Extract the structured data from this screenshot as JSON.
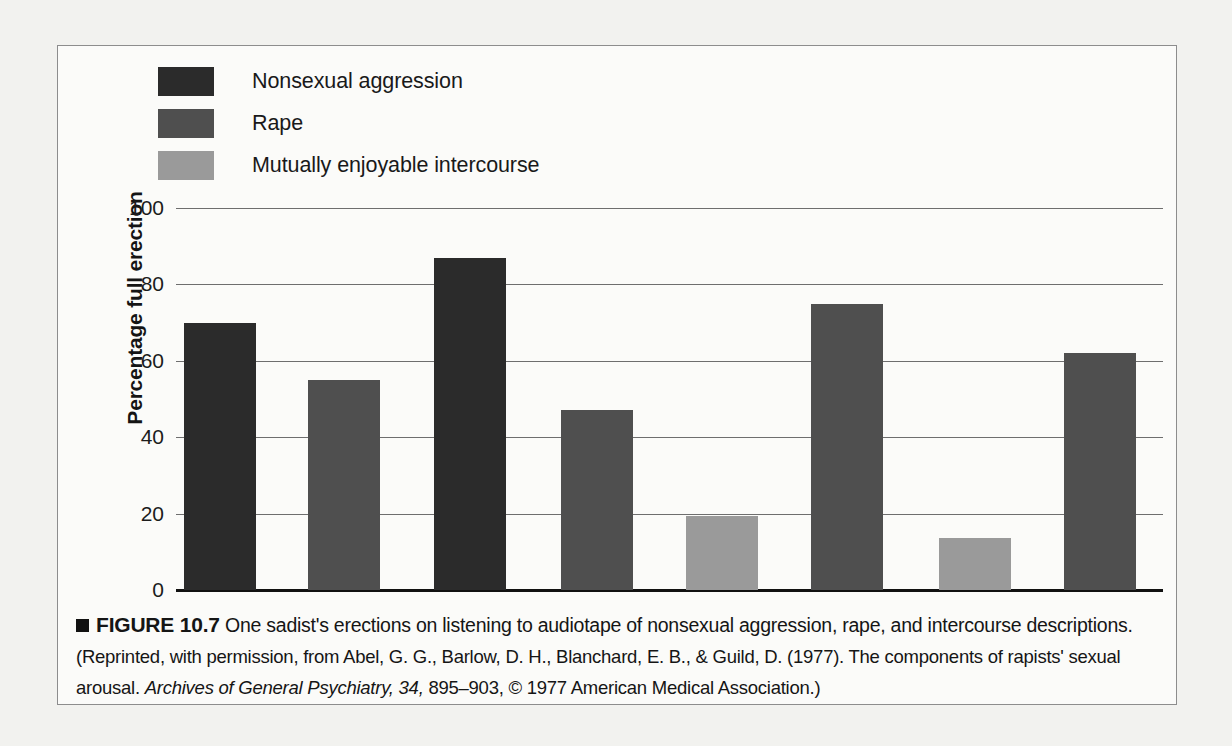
{
  "figure": {
    "marker": "■",
    "label": "FIGURE 10.7",
    "caption_main": "One sadist's erections on listening to audiotape of nonsexual aggression, rape, and intercourse descriptions.",
    "caption_source_pre": "(Reprinted, with permission, from Abel, G. G., Barlow, D. H., Blanchard, E. B., & Guild, D. (1977). The components of rapists' sexual arousal. ",
    "caption_source_italic": "Archives of General Psychiatry, 34,",
    "caption_source_post": " 895–903, © 1977 American Medical Association.)"
  },
  "colors": {
    "nonsexual_aggression": "#2b2b2b",
    "rape": "#4f4f4f",
    "mutually_enjoyable_intercourse": "#9a9a9a",
    "gridline": "#6e6e6e",
    "axis": "#111111",
    "frame": "#8d8d8d",
    "page_background": "#f2f2ef",
    "figure_background": "#fbfbf9"
  },
  "chart_data": {
    "type": "bar",
    "title": "",
    "xlabel": "",
    "ylabel": "Percentage full erection",
    "ylim": [
      0,
      100
    ],
    "yticks": [
      0,
      20,
      40,
      60,
      80,
      100
    ],
    "ytick_labels": [
      "0",
      "20",
      "40",
      "60",
      "80",
      "100"
    ],
    "grid": true,
    "legend_position": "above-left",
    "legend": [
      "Nonsexual aggression",
      "Rape",
      "Mutually enjoyable intercourse"
    ],
    "categories": [
      "1",
      "2",
      "3",
      "4",
      "5",
      "6",
      "7",
      "8"
    ],
    "values": [
      70,
      55,
      87,
      47,
      19.5,
      75,
      13.5,
      62
    ],
    "bar_series": [
      {
        "index": 1,
        "series": "Nonsexual aggression",
        "value": 70
      },
      {
        "index": 2,
        "series": "Rape",
        "value": 55
      },
      {
        "index": 3,
        "series": "Nonsexual aggression",
        "value": 87
      },
      {
        "index": 4,
        "series": "Rape",
        "value": 47
      },
      {
        "index": 5,
        "series": "Mutually enjoyable intercourse",
        "value": 19.5
      },
      {
        "index": 6,
        "series": "Rape",
        "value": 75
      },
      {
        "index": 7,
        "series": "Mutually enjoyable intercourse",
        "value": 13.5
      },
      {
        "index": 8,
        "series": "Rape",
        "value": 62
      }
    ]
  }
}
